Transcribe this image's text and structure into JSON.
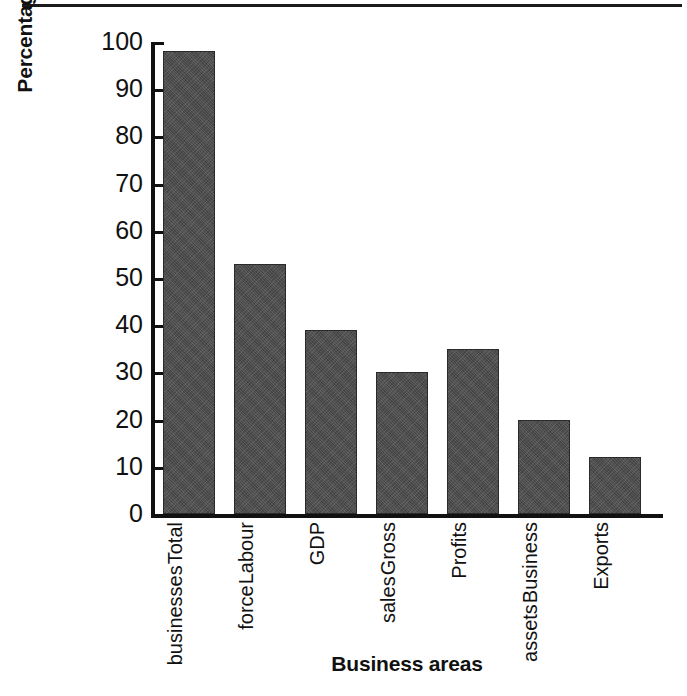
{
  "chart_data": {
    "type": "bar",
    "title": "",
    "xlabel": "Business areas",
    "ylabel": "Percentage contributed by small business",
    "categories": [
      "Total businesses",
      "Labour force",
      "GDP",
      "Gross sales",
      "Profits",
      "Business assets",
      "Exports"
    ],
    "values": [
      98,
      53,
      39,
      30,
      35,
      20,
      12
    ],
    "ylim": [
      0,
      100
    ],
    "yticks": [
      0,
      10,
      20,
      30,
      40,
      50,
      60,
      70,
      80,
      90,
      100
    ],
    "ytick_labels": [
      "0",
      "10",
      "20",
      "30",
      "40",
      "50",
      "60",
      "70",
      "80",
      "90",
      "100"
    ],
    "grid": false,
    "legend": "none",
    "bar_color": "#4c4c4c",
    "axis_color": "#111111"
  }
}
